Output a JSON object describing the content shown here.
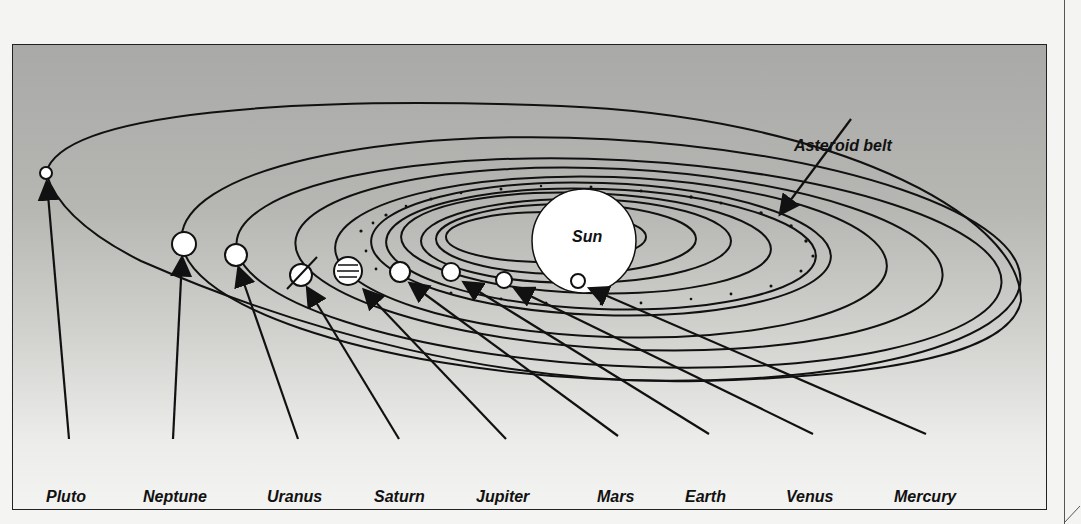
{
  "diagram": {
    "title_labels": {
      "sun": "Sun",
      "asteroid_belt": "Asteroid belt"
    },
    "planets": [
      {
        "name": "Pluto",
        "label_x": 36,
        "body": {
          "x": 45,
          "y": 172,
          "r": 6
        }
      },
      {
        "name": "Neptune",
        "label_x": 134,
        "body": {
          "x": 183,
          "y": 243,
          "r": 12
        }
      },
      {
        "name": "Uranus",
        "label_x": 266,
        "body": {
          "x": 235,
          "y": 254,
          "r": 11
        }
      },
      {
        "name": "Saturn",
        "label_x": 375,
        "body": {
          "x": 300,
          "y": 274,
          "r": 11
        }
      },
      {
        "name": "Jupiter",
        "label_x": 475,
        "body": {
          "x": 347,
          "y": 270,
          "r": 14
        }
      },
      {
        "name": "Mars",
        "label_x": 596,
        "body": {
          "x": 399,
          "y": 271,
          "r": 10
        }
      },
      {
        "name": "Earth",
        "label_x": 684,
        "body": {
          "x": 450,
          "y": 271,
          "r": 9
        }
      },
      {
        "name": "Venus",
        "label_x": 783,
        "body": {
          "x": 503,
          "y": 279,
          "r": 8
        }
      },
      {
        "name": "Mercury",
        "label_x": 893,
        "body": {
          "x": 577,
          "y": 280,
          "r": 7
        }
      }
    ],
    "colors": {
      "ink": "#111111",
      "body_fill": "#ffffff",
      "background_top": "#a9a9a7",
      "background_bottom": "#f3f3f1"
    }
  }
}
